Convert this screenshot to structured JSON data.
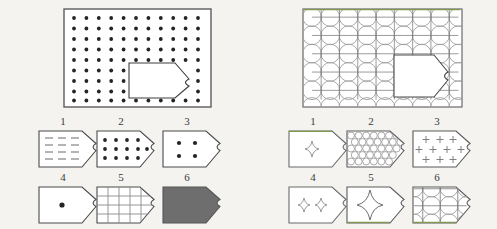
{
  "figure": {
    "title": "",
    "background_color": "#f4f3f0",
    "stroke_color": "#4a4a4a",
    "light_stroke_color": "#8c8c8c",
    "accent_green": "#7f9a4e",
    "fill_gray": "#6e6e6e",
    "page_width": 497,
    "page_height": 229
  },
  "panels": {
    "left": {
      "name": "left-panel",
      "big_shape": {
        "name": "dot-grid-rectangle",
        "x": 63,
        "y": 8,
        "width": 148,
        "height": 99,
        "pattern": "square-dot-grid",
        "dot_columns": 12,
        "dot_rows": 9,
        "dot_color": "#2d2d2d",
        "inset_tag": {
          "name": "inset-tag-outline",
          "x": 128,
          "y": 61,
          "width": 70,
          "height": 38,
          "notch": "right-arrow-with-concave-tip"
        }
      },
      "cells": [
        {
          "num": "1",
          "name": "cell-left-1",
          "pattern": "dashed-horizontal-lines",
          "fill": "none"
        },
        {
          "num": "2",
          "name": "cell-left-2",
          "pattern": "dot-grid-4x3",
          "fill": "none"
        },
        {
          "num": "3",
          "name": "cell-left-3",
          "pattern": "dots-2x2",
          "fill": "none"
        },
        {
          "num": "4",
          "name": "cell-left-4",
          "pattern": "single-center-dot",
          "fill": "none"
        },
        {
          "num": "5",
          "name": "cell-left-5",
          "pattern": "square-grid-lines",
          "fill": "none"
        },
        {
          "num": "6",
          "name": "cell-left-6",
          "pattern": "solid-fill",
          "fill": "#6e6e6e"
        }
      ]
    },
    "right": {
      "name": "right-panel",
      "big_shape": {
        "name": "circle-lattice-rectangle",
        "x": 302,
        "y": 8,
        "width": 161,
        "height": 99,
        "pattern": "circle-lattice-with-star-nodes",
        "lattice_columns": 9,
        "lattice_rows": 6,
        "top_edge_color": "#7f9a4e",
        "inset_tag": {
          "name": "inset-tag-outline",
          "x": 394,
          "y": 55,
          "width": 66,
          "height": 42,
          "notch": "right-arrow-with-concave-tip"
        }
      },
      "cells": [
        {
          "num": "1",
          "name": "cell-right-1",
          "pattern": "single-four-point-star",
          "fill": "none",
          "edge_accent": "top"
        },
        {
          "num": "2",
          "name": "cell-right-2",
          "pattern": "hex-packed-circles",
          "fill": "none"
        },
        {
          "num": "3",
          "name": "cell-right-3",
          "pattern": "plus-signs",
          "fill": "none"
        },
        {
          "num": "4",
          "name": "cell-right-4",
          "pattern": "two-four-point-stars",
          "fill": "none"
        },
        {
          "num": "5",
          "name": "cell-right-5",
          "pattern": "large-four-point-star",
          "fill": "none",
          "edge_accent": "bottom"
        },
        {
          "num": "6",
          "name": "cell-right-6",
          "pattern": "circle-lattice-3x2",
          "fill": "none",
          "edge_accent": "bottom"
        }
      ]
    }
  }
}
